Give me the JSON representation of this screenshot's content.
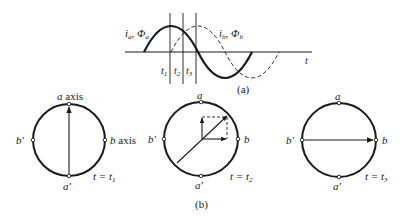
{
  "figure": {
    "colors": {
      "ink": "#1a1a1a",
      "background": "#ffffff"
    },
    "part_a": {
      "caption": "(a)",
      "time_axis_label": "t",
      "curve_a_label": "i",
      "curve_a_label_sub": "a",
      "curve_a_label_sep": ", Φ",
      "curve_a_label_sub2": "a",
      "curve_b_label": "i",
      "curve_b_label_sub": "b",
      "curve_b_label_sep": ", Φ",
      "curve_b_label_sub2": "b",
      "time_markers": [
        {
          "label": "t",
          "sub": "1"
        },
        {
          "label": "t",
          "sub": "2"
        },
        {
          "label": "t",
          "sub": "3"
        }
      ],
      "curve_a_style": "solid-thick",
      "curve_b_style": "dashed-thin"
    },
    "part_b": {
      "caption": "(b)",
      "panels": [
        {
          "top_label": "a",
          "top_label_extra": " axis",
          "bottom_label": "a′",
          "left_label": "b′",
          "right_label": "b",
          "right_label_extra": " axis",
          "time_label": "t = t",
          "time_sub": "1",
          "resultant_direction": "up (along a axis)"
        },
        {
          "top_label": "a",
          "top_label_extra": "",
          "bottom_label": "a′",
          "left_label": "b′",
          "right_label": "b",
          "right_label_extra": "",
          "time_label": "t = t",
          "time_sub": "2",
          "resultant_direction": "45° between a and b (vector sum of components)"
        },
        {
          "top_label": "a",
          "top_label_extra": "",
          "bottom_label": "a′",
          "left_label": "b′",
          "right_label": "b",
          "right_label_extra": "",
          "time_label": "t = t",
          "time_sub": "3",
          "resultant_direction": "right (along b axis)"
        }
      ]
    }
  }
}
